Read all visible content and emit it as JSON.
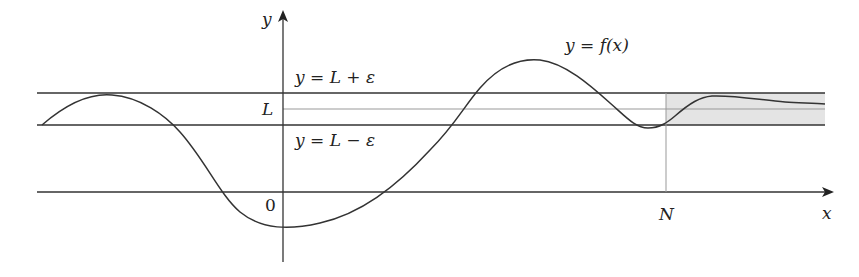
{
  "figure": {
    "labels": {
      "y_axis": "y",
      "x_axis": "x",
      "upper_band": "y = L + ε",
      "lower_band": "y = L − ε",
      "limit": "L",
      "origin": "0",
      "n_marker": "N",
      "curve": "y = f(x)"
    },
    "colors": {
      "line": "#333333",
      "thin_line": "#888888",
      "shade": "#e4e4e4"
    }
  }
}
